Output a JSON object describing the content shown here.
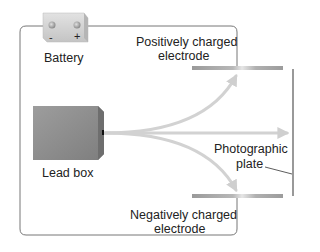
{
  "labels": {
    "battery": "Battery",
    "battery_minus": "-",
    "battery_plus": "+",
    "positive_electrode_line1": "Positively charged",
    "positive_electrode_line2": "electrode",
    "lead_box": "Lead box",
    "photographic_plate_line1": "Photographic",
    "photographic_plate_line2": "plate",
    "negative_electrode_line1": "Negatively charged",
    "negative_electrode_line2": "electrode"
  },
  "colors": {
    "wire": "#777777",
    "electrode": "#a8a8a8",
    "ray": "#d0d0d0",
    "lead_box": "#8f8f8f",
    "battery": "#d4d4d4",
    "plate": "#777777"
  }
}
